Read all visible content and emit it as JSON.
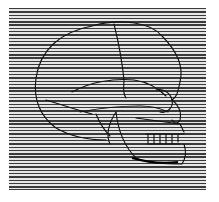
{
  "image": {
    "subject": "skull-profile-illustration",
    "style": "horizontal line screen engraving",
    "colors": {
      "background": "#ffffff",
      "line": "#3a3a3a",
      "gap": "#e6e6e6",
      "outline": "#111111"
    }
  }
}
